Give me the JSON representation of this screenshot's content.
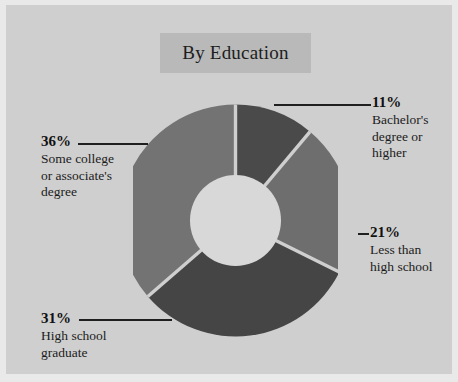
{
  "chart_data": {
    "type": "pie",
    "variant": "donut",
    "title": "By Education",
    "categories": [
      "Bachelor's degree or higher",
      "Less than high school",
      "High school graduate",
      "Some college or associate's degree"
    ],
    "values": [
      11,
      21,
      31,
      36
    ],
    "value_labels": [
      "11%",
      "21%",
      "31%",
      "36%"
    ],
    "unit": "percent",
    "xlabel": "",
    "ylabel": "",
    "legend": "none",
    "grid": false,
    "start_angle_deg": 0,
    "direction": "clockwise",
    "colors": [
      "#4a4a4a",
      "#6e6e6e",
      "#454545",
      "#737373"
    ],
    "slices": [
      {
        "label_pct": "11%",
        "label_text": "Bachelor's degree or higher",
        "label_lines": [
          "Bachelor's",
          "degree or",
          "higher"
        ],
        "value": 11,
        "color": "#4a4a4a"
      },
      {
        "label_pct": "21%",
        "label_text": "Less than high school",
        "label_lines": [
          "Less than",
          "high school"
        ],
        "value": 21,
        "color": "#6e6e6e"
      },
      {
        "label_pct": "31%",
        "label_text": "High school graduate",
        "label_lines": [
          "High school",
          "graduate"
        ],
        "value": 31,
        "color": "#454545"
      },
      {
        "label_pct": "36%",
        "label_text": "Some college or associate's degree",
        "label_lines": [
          "Some college",
          "or associate's",
          "degree"
        ],
        "value": 36,
        "color": "#737373"
      }
    ]
  },
  "header": {
    "title": "By Education"
  },
  "colors": {
    "background": "#cfcfcf",
    "outer_margin": "#e9e9e9",
    "title_banner": "#b9b9b9",
    "donut_hole": "#d8d8d8",
    "slice_gap": "#cfcfcf",
    "text": "#1c1c1c",
    "leader_line": "#1f1f1f"
  },
  "callouts": {
    "bachelors": {
      "pct": "11%",
      "line1": "Bachelor's",
      "line2": "degree or",
      "line3": "higher"
    },
    "less_than_high_school": {
      "pct": "21%",
      "line1": "Less than",
      "line2": "high school"
    },
    "high_school_graduate": {
      "pct": "31%",
      "line1": "High school",
      "line2": "graduate"
    },
    "some_college": {
      "pct": "36%",
      "line1": "Some college",
      "line2": "or associate's",
      "line3": "degree"
    }
  }
}
